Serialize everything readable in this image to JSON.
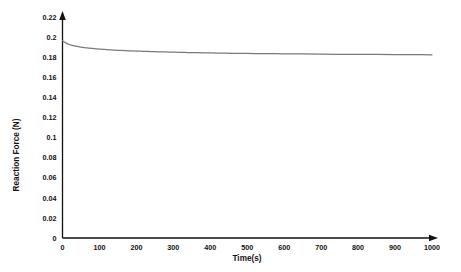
{
  "chart_data": {
    "type": "line",
    "title": "",
    "subtitle": "",
    "xlabel": "Time(s)",
    "ylabel": "Reaction Force (N)",
    "xlim": [
      0,
      1000
    ],
    "ylim": [
      0,
      0.22
    ],
    "grid": false,
    "legend": false,
    "legend_position": "none",
    "x_ticks": [
      0,
      100,
      200,
      300,
      400,
      500,
      600,
      700,
      800,
      900,
      1000
    ],
    "x_tick_labels": [
      "0",
      "100",
      "200",
      "300",
      "400",
      "500",
      "600",
      "700",
      "800",
      "900",
      "1000"
    ],
    "y_ticks": [
      0,
      0.02,
      0.04,
      0.06,
      0.08,
      0.1,
      0.12,
      0.14,
      0.16,
      0.18,
      0.2,
      0.22
    ],
    "y_tick_labels": [
      "0",
      "0.02",
      "0.04",
      "0.06",
      "0.08",
      "0.1",
      "0.12",
      "0.14",
      "0.16",
      "0.18",
      "0.2",
      "0.22"
    ],
    "series": [
      {
        "name": "Reaction Force",
        "color": "#7a7a7a",
        "x": [
          0,
          5,
          10,
          15,
          20,
          25,
          30,
          40,
          50,
          60,
          70,
          80,
          90,
          100,
          120,
          140,
          160,
          180,
          200,
          220,
          240,
          260,
          280,
          300,
          330,
          360,
          400,
          440,
          480,
          520,
          560,
          600,
          650,
          700,
          750,
          800,
          850,
          900,
          950,
          1000
        ],
        "values": [
          0.197,
          0.1955,
          0.1944,
          0.1936,
          0.1929,
          0.1924,
          0.1919,
          0.1911,
          0.1904,
          0.1899,
          0.1895,
          0.1891,
          0.1888,
          0.1885,
          0.188,
          0.1875,
          0.1871,
          0.1868,
          0.1865,
          0.1862,
          0.186,
          0.1858,
          0.1856,
          0.1854,
          0.1851,
          0.1849,
          0.1846,
          0.1844,
          0.1842,
          0.184,
          0.1839,
          0.1837,
          0.1836,
          0.1834,
          0.1833,
          0.1832,
          0.1831,
          0.183,
          0.1829,
          0.1828
        ]
      }
    ],
    "annotations": []
  },
  "axes": {
    "x_axis_name": "time-axis",
    "y_axis_name": "reaction-force-axis",
    "arrowheads": true
  },
  "colors": {
    "series": "#7a7a7a",
    "axis": "#111111",
    "text": "#111111",
    "background": "#ffffff"
  }
}
